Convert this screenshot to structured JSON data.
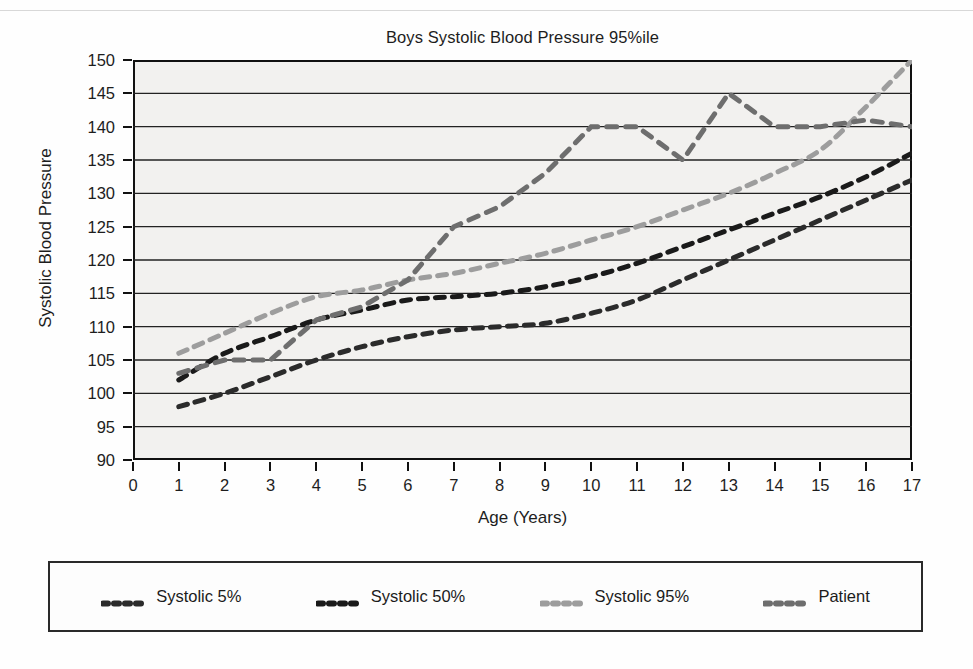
{
  "chart_data": {
    "type": "line",
    "title": "Boys Systolic Blood Pressure 95%ile",
    "xlabel": "Age (Years)",
    "ylabel": "Systolic Blood Pressure",
    "xlim": [
      0,
      17
    ],
    "ylim": [
      90,
      150
    ],
    "xticks": [
      0,
      1,
      2,
      3,
      4,
      5,
      6,
      7,
      8,
      9,
      10,
      11,
      12,
      13,
      14,
      15,
      16,
      17
    ],
    "yticks": [
      90,
      95,
      100,
      105,
      110,
      115,
      120,
      125,
      130,
      135,
      140,
      145,
      150
    ],
    "grid": "horizontal",
    "legend_position": "below-plot",
    "linestyle": "dashed",
    "series": [
      {
        "name": "Systolic 5%",
        "color": "#2b2b2b",
        "x": [
          1,
          2,
          3,
          4,
          5,
          6,
          7,
          8,
          9,
          10,
          11,
          12,
          13,
          14,
          15,
          16,
          17
        ],
        "values": [
          98,
          100,
          102.5,
          105,
          107,
          108.5,
          109.5,
          110,
          110.5,
          112,
          114,
          117,
          120,
          123,
          126,
          129,
          132
        ]
      },
      {
        "name": "Systolic 50%",
        "color": "#1a1a1a",
        "x": [
          1,
          2,
          3,
          4,
          5,
          6,
          7,
          8,
          9,
          10,
          11,
          12,
          13,
          14,
          15,
          16,
          17
        ],
        "values": [
          102,
          106,
          108.5,
          111,
          112.5,
          114,
          114.5,
          115,
          116,
          117.5,
          119.5,
          122,
          124.5,
          127,
          129.5,
          132.5,
          136
        ]
      },
      {
        "name": "Systolic 95%",
        "color": "#9d9d9d",
        "x": [
          1,
          2,
          3,
          4,
          5,
          6,
          7,
          8,
          9,
          10,
          11,
          12,
          13,
          14,
          15,
          16,
          17
        ],
        "values": [
          106,
          109,
          112,
          114.5,
          115.5,
          117,
          118,
          119.5,
          121,
          123,
          125,
          127.5,
          130,
          133,
          136.5,
          143,
          150
        ]
      },
      {
        "name": "Patient",
        "color": "#6e6e6e",
        "x": [
          1,
          2,
          3,
          4,
          5,
          6,
          7,
          8,
          9,
          10,
          11,
          12,
          13,
          14,
          15,
          16,
          17
        ],
        "values": [
          103,
          105,
          105,
          111,
          113,
          117,
          125,
          128,
          133,
          140,
          140,
          135,
          145,
          140,
          140,
          141,
          140
        ]
      }
    ]
  },
  "legend": {
    "items": [
      {
        "label": "Systolic 5%",
        "color": "#2b2b2b"
      },
      {
        "label": "Systolic 50%",
        "color": "#1a1a1a"
      },
      {
        "label": "Systolic 95%",
        "color": "#9d9d9d"
      },
      {
        "label": "Patient",
        "color": "#6e6e6e"
      }
    ]
  }
}
